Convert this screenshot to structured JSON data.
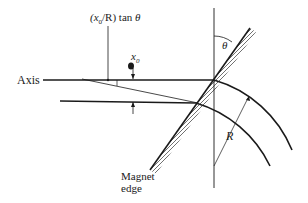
{
  "diagram": {
    "labels": {
      "axis": "Axis",
      "displacement_formula_prefix": "(x",
      "displacement_formula_sub": "0",
      "displacement_formula_mid": "/R) tan ",
      "displacement_formula_theta": "θ",
      "x0_main": "x",
      "x0_sub": "0",
      "theta": "θ",
      "radius": "R",
      "magnet_edge_line1": "Magnet",
      "magnet_edge_line2": "edge"
    },
    "colors": {
      "ink": "#1a1a1a",
      "background": "#ffffff"
    }
  }
}
